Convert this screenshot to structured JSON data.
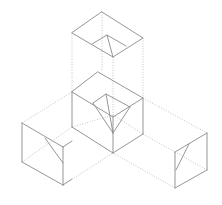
{
  "diagram": {
    "colors": {
      "solid": "#8a8a8a",
      "hidden": "#b4b4b4",
      "background": "#ffffff"
    },
    "components": [
      {
        "id": "top-cube",
        "label": "Top cube (exploded upward)"
      },
      {
        "id": "center-cube",
        "label": "Center cube"
      },
      {
        "id": "left-cube",
        "label": "Left arm cube"
      },
      {
        "id": "right-cube",
        "label": "Right arm cube"
      }
    ]
  }
}
